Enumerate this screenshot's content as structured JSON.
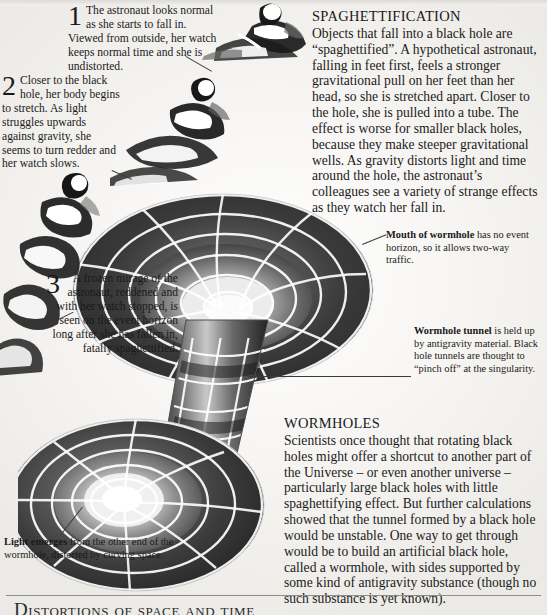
{
  "page": {
    "background_color": "#f2f1ef",
    "ink_color": "#1a1a1a",
    "footer_rule_color": "#8c8c8c",
    "footer_title": "Distortions of space and time"
  },
  "steps": [
    {
      "number": "1",
      "text": "The astronaut looks normal as she starts to fall in. Viewed from outside, her watch keeps normal time and she is undistorted."
    },
    {
      "number": "2",
      "text": "Closer to the black hole, her body begins to stretch. As light struggles upwards against gravity, she seems to turn redder and her watch slows."
    },
    {
      "number": "3",
      "text": "A frozen mirage of the astronaut, reddened and with her watch stopped, is seen on the event horizon long after she has fallen in, fatally spaghettified."
    }
  ],
  "sections": [
    {
      "id": "spaghettification",
      "heading": "SPAGHETTIFICATION",
      "body": "Objects that fall into a black hole are “spaghettified”. A hypothetical astronaut, falling in feet first, feels a stronger gravitational pull on her feet than her head, so she is stretched apart. Closer to the hole, she is pulled into a tube. The effect is worse for smaller black holes, because they make steeper gravitational wells. As gravity distorts light and time around the hole, the astronaut’s colleagues see a variety of strange effects as they watch her fall in."
    },
    {
      "id": "wormholes",
      "heading": "WORMHOLES",
      "body": "Scientists once thought that rotating black holes might offer a shortcut to another part of the Universe – or even another universe – particularly large black holes with little spaghettifying effect. But further calculations showed that the tunnel formed by a black hole would be unstable. One way to get through would be to build an artificial black hole, called a wormhole, with sides supported by some kind of antigravity substance (though no such substance is yet known)."
    }
  ],
  "callouts": [
    {
      "id": "mouth-of-wormhole",
      "lead": "Mouth of wormhole",
      "text": " has no event horizon, so it allows two-way traffic."
    },
    {
      "id": "wormhole-tunnel",
      "lead": "Wormhole tunnel",
      "text": " is held up by antigravity material. Black hole tunnels are thought to “pinch off” at the singularity."
    },
    {
      "id": "light-emerges",
      "lead": "Light emerges",
      "text": " from the other end of the wormhole, distorted by curving space."
    }
  ],
  "figure": {
    "name": "wormhole-diagram",
    "grid_color": "#ffffff",
    "surface_dark": "#3b3b3b",
    "surface_light": "#d8d8d8"
  },
  "astronauts": [
    {
      "id": "astronaut-1",
      "state": "undistorted"
    },
    {
      "id": "astronaut-2",
      "state": "stretching"
    },
    {
      "id": "astronaut-3",
      "state": "spaghettified"
    }
  ]
}
